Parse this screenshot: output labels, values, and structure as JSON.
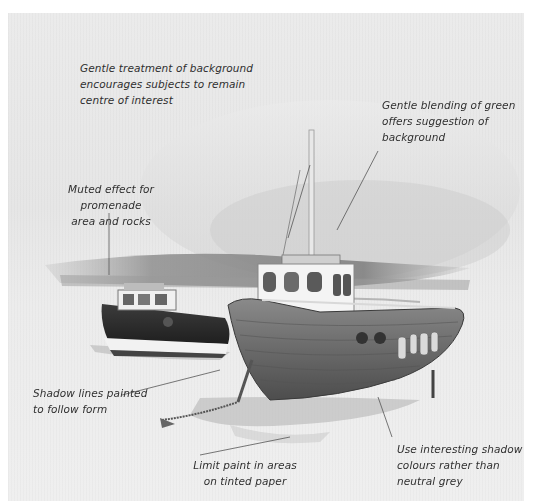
{
  "illustration": {
    "subject": "Two fishing boats beached on a tinted paper shoreline",
    "palette": {
      "paper": "#e9e9e9",
      "sky_wash": "#d6d6d6",
      "background_band": "#8a8a8a",
      "hull_dark": "#2e2e2e",
      "hull_wood": "#6d6d6d",
      "cabin_white": "#f2f2f2",
      "shadow": "#bdbdbd",
      "annotation_text": "#2f2f2f",
      "leader_line": "#555555"
    }
  },
  "annotations": [
    {
      "id": "background",
      "text": "Gentle treatment of background\nencourages subjects to remain\ncentre of interest"
    },
    {
      "id": "green",
      "text": "Gentle blending of green\noffers suggestion of\nbackground"
    },
    {
      "id": "promenade",
      "text": "Muted effect for promenade\narea and rocks"
    },
    {
      "id": "shadow-lines",
      "text": "Shadow lines painted\nto follow form"
    },
    {
      "id": "limit-paint",
      "text": "Limit paint in areas\non tinted paper"
    },
    {
      "id": "shadow-colours",
      "text": "Use interesting shadow\ncolours rather than\nneutral grey"
    }
  ]
}
